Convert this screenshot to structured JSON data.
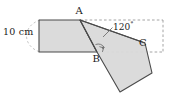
{
  "figure": {
    "type": "geometry-diagram",
    "canvas": {
      "width": 175,
      "height": 99,
      "background": "#ffffff"
    },
    "labels": {
      "dimension": "10 cm",
      "vertex_a": "A",
      "vertex_b": "B",
      "vertex_c": "C",
      "angle_value": "120",
      "angle_unit": "°"
    },
    "colors": {
      "fill": "#d6d6d6",
      "stroke": "#4a4a4a",
      "dashed": "#9a9a9a",
      "text": "#1a1a1a"
    },
    "points": {
      "A": {
        "x": 80,
        "y": 20
      },
      "B": {
        "x": 97,
        "y": 52
      },
      "C": {
        "x": 145,
        "y": 43
      },
      "rect_top_left": {
        "x": 39,
        "y": 20
      },
      "rect_bottom_left": {
        "x": 39,
        "y": 52
      },
      "lower_right": {
        "x": 152,
        "y": 73
      },
      "lower_bottom": {
        "x": 120,
        "y": 92
      }
    },
    "shapes": {
      "original_quad": "39,20 80,20 97,52 39,52",
      "rotated_quad": "80,20 145,43 152,73 120,92 97,52",
      "dashed_rect": "80,20 163,20 163,52 97,52",
      "dimension_arc": "left vertical extent arc from top-left to bottom-left"
    },
    "annotations": {
      "right_angle_marker_at": "B",
      "angle_arc_at": "B",
      "leader_line": "from 120 label down-left to angle arc at B"
    }
  }
}
